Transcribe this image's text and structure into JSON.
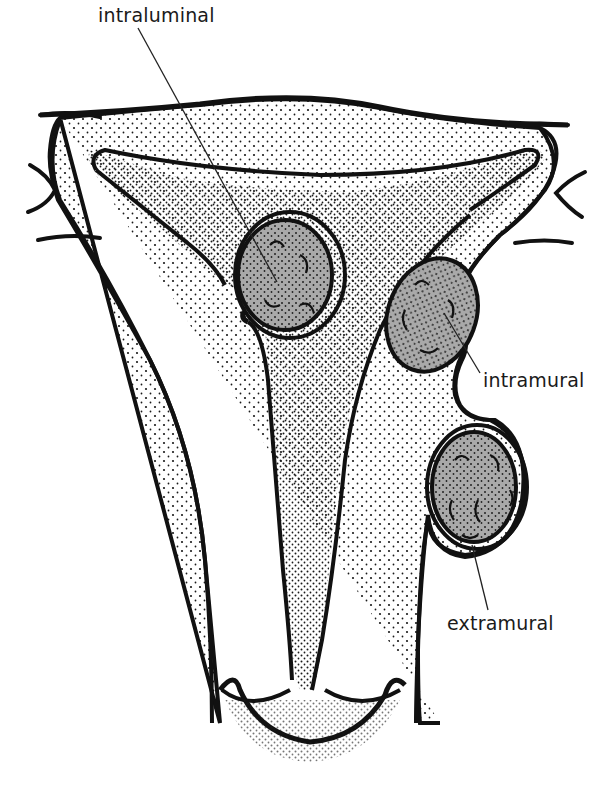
{
  "figure": {
    "colors": {
      "outline": "#111111",
      "fibroid_fill": "#a9a9a9",
      "stipple": "#1a1a1a",
      "background": "#ffffff",
      "label_text": "#1a1a1a"
    }
  },
  "labels": {
    "intraluminal": "intraluminal",
    "intramural": "intramural",
    "extramural": "extramural"
  }
}
